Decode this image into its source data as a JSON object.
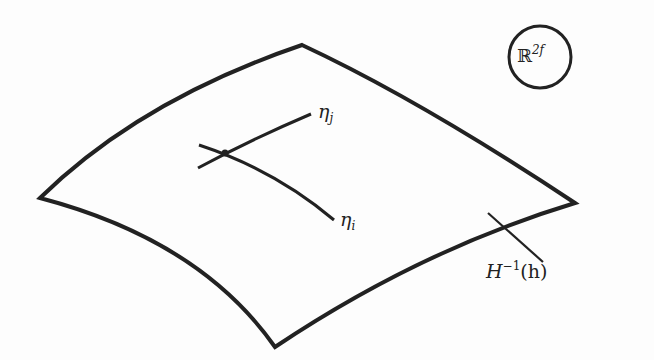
{
  "figure": {
    "type": "schematic surface diagram",
    "space_label": {
      "base": "ℝ",
      "sup": "2f"
    },
    "curves": [
      {
        "name": "eta_j",
        "base": "η",
        "sub": "j"
      },
      {
        "name": "eta_i",
        "base": "η",
        "sub": "i"
      }
    ],
    "surface_label": {
      "base": "H",
      "sup": "−1",
      "tail": "(h)"
    },
    "colors": {
      "stroke": "#222222",
      "background": "#fdfdfd"
    }
  }
}
